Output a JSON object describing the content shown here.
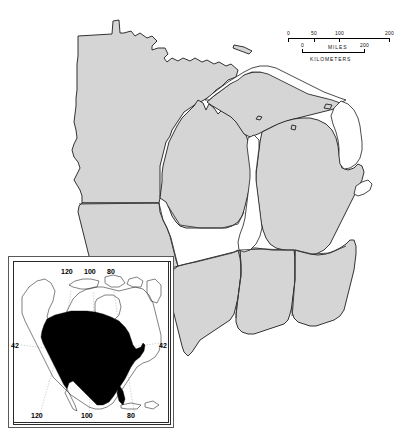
{
  "figure": {
    "name": "north-central-united-states-distribution-map",
    "background_color": "#ffffff",
    "land_fill_color": "#d5d5d5",
    "land_outline_color": "#1d1d1d",
    "lake_fill_color": "#ffffff",
    "range_fill_color": "#000000"
  },
  "scale_bar": {
    "name": "scale-bar",
    "miles": {
      "unit_label": "MILES",
      "tick_labels": [
        "0",
        "50",
        "100",
        "200"
      ],
      "tick_values": [
        0,
        50,
        100,
        200
      ]
    },
    "kilometers": {
      "unit_label": "KILOMETERS",
      "tick_labels": [
        "0",
        "200"
      ],
      "tick_values": [
        0,
        200
      ]
    }
  },
  "inset": {
    "name": "north-america-locator-inset",
    "longitude_labels_top": [
      "120",
      "100",
      "80"
    ],
    "longitude_labels_bottom": [
      "120",
      "100",
      "80"
    ],
    "latitude_label_left": "42",
    "latitude_label_right": "42",
    "range_shading": "solid black"
  },
  "main_map": {
    "name": "main-map",
    "states_shown": [
      "Minnesota",
      "Wisconsin",
      "Michigan",
      "Iowa",
      "Illinois",
      "Indiana",
      "Ohio"
    ],
    "lakes_shown": [
      "Lake Superior",
      "Lake Michigan",
      "Lake Huron",
      "Lake Erie",
      "Lake St. Clair"
    ]
  }
}
